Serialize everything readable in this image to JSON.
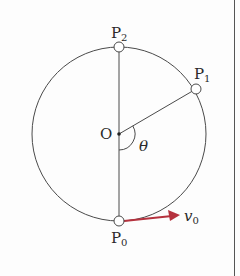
{
  "diagram": {
    "type": "circular-motion",
    "center": {
      "label": "O",
      "x": 119,
      "y": 134
    },
    "radius": 87,
    "points": [
      {
        "id": "P0",
        "base": "P",
        "sub": "0",
        "x": 119,
        "y": 221
      },
      {
        "id": "P1",
        "base": "P",
        "sub": "1",
        "x": 196,
        "y": 89
      },
      {
        "id": "P2",
        "base": "P",
        "sub": "2",
        "x": 119,
        "y": 47
      }
    ],
    "angle": {
      "label": "θ",
      "from": "OP0",
      "to": "OP1"
    },
    "velocity": {
      "label": "v",
      "sub": "0",
      "color": "#b5323e",
      "direction": "right"
    },
    "colors": {
      "line": "#4a4a4a",
      "arrow": "#b5323e",
      "border": "#555555"
    }
  }
}
